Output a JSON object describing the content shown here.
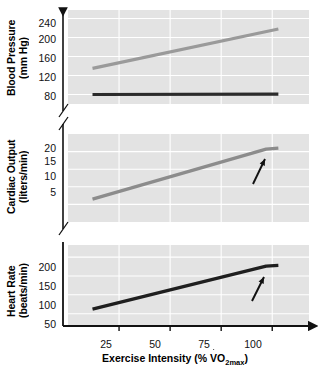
{
  "chart_data": {
    "type": "line",
    "title": "",
    "xlabel_prefix": "Exercise Intensity (% ",
    "xlabel_v": "V",
    "xlabel_sub": "2max",
    "xlabel_o": "O",
    "xlabel_suffix": ")",
    "x_ticks": [
      25,
      50,
      75,
      100
    ],
    "x_tick_labels": [
      "25",
      "50",
      "75",
      "100"
    ],
    "xlim": [
      0,
      118
    ],
    "grid": true,
    "legend": "inline-labels",
    "panels": [
      {
        "id": "blood-pressure",
        "ylabel_line1": "Blood Pressure",
        "ylabel_line2": "(mm Hg)",
        "y_ticks": [
          80,
          120,
          160,
          200,
          240
        ],
        "y_tick_labels": [
          "80",
          "120",
          "160",
          "200",
          "240"
        ],
        "ylim": [
          60,
          258
        ],
        "axis_break": true,
        "series": [
          {
            "name": "Systotic",
            "label": "Systotic",
            "color": "#9a9a9a",
            "x": [
              12,
              103
            ],
            "values": [
              135,
              218
            ]
          },
          {
            "name": "Diastotic",
            "label": "Diastotic",
            "color": "#2b2b2b",
            "x": [
              12,
              103
            ],
            "values": [
              80,
              81
            ]
          }
        ]
      },
      {
        "id": "cardiac-output",
        "ylabel_line1": "Cardiac Output",
        "ylabel_line2": "(liters/min)",
        "y_ticks": [
          5,
          10,
          15,
          20
        ],
        "y_tick_labels": [
          "5",
          "10",
          "15",
          "20"
        ],
        "ylim": [
          0,
          25
        ],
        "axis_break": true,
        "annotation": {
          "text_v": "V",
          "text_o": "O",
          "text_sub": "2max",
          "arrow": true
        },
        "series": [
          {
            "name": "Cardiac Output",
            "label": "",
            "color": "#8c8c8c",
            "x": [
              12,
              97,
              103
            ],
            "values": [
              6.5,
              20.7,
              21.0
            ]
          }
        ]
      },
      {
        "id": "heart-rate",
        "ylabel_line1": "Heart  Rate",
        "ylabel_line2": "(beats/min)",
        "y_ticks": [
          50,
          100,
          150,
          200
        ],
        "y_tick_labels": [
          "50",
          "100",
          "150",
          "200"
        ],
        "ylim": [
          20,
          232
        ],
        "axis_break": false,
        "annotation": {
          "text_v": "V",
          "text_o": "O",
          "text_sub": "2max",
          "arrow": true
        },
        "series": [
          {
            "name": "Heart Rate",
            "label": "",
            "color": "#1f1f1f",
            "x": [
              12,
              97,
              103
            ],
            "values": [
              62,
              176,
              178
            ]
          }
        ]
      }
    ]
  },
  "colors": {
    "plot_background": "#e3e3e3",
    "gridline": "#ffffff",
    "axis": "#111111",
    "systolic": "#9a9a9a",
    "diastolic": "#2b2b2b",
    "cardiac": "#8c8c8c",
    "heart_rate": "#1f1f1f"
  }
}
